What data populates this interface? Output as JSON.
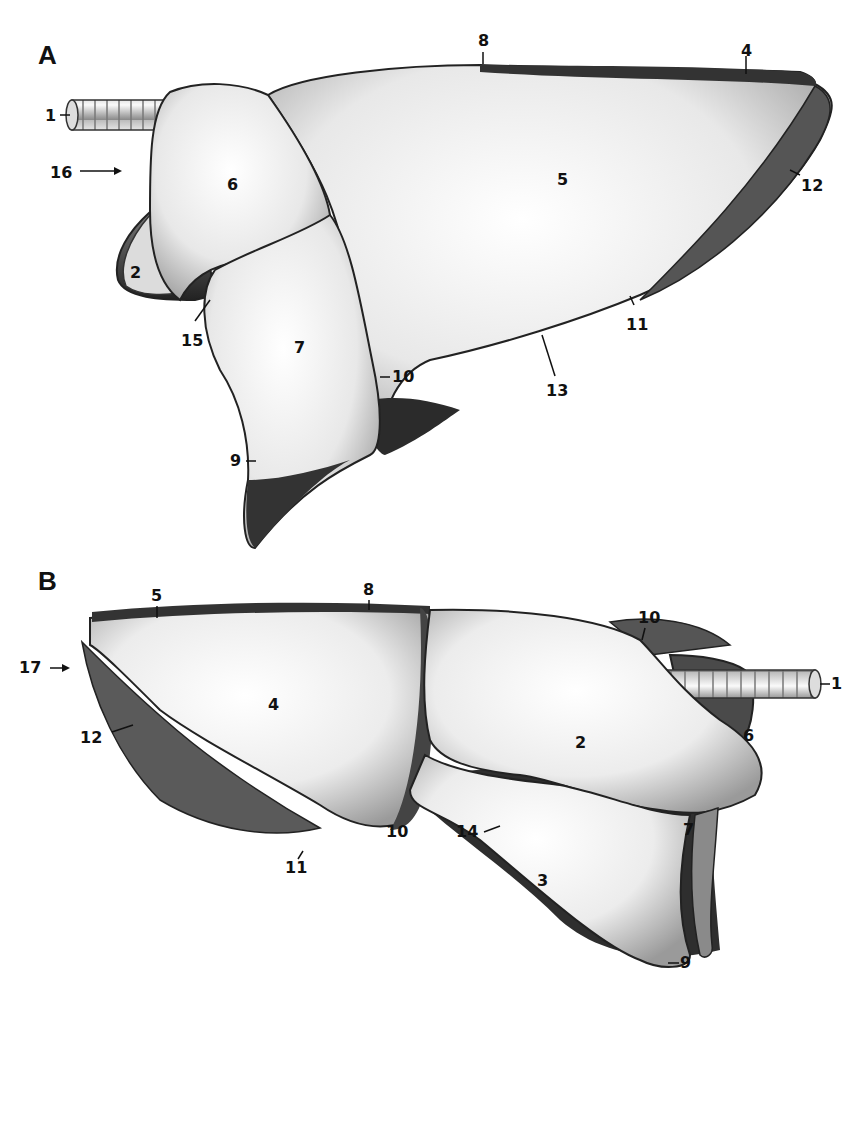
{
  "figure": {
    "panels": [
      {
        "id": "A",
        "letter": "A",
        "labels": {
          "l1": "1",
          "l16": "16",
          "l6": "6",
          "l2": "2",
          "l15": "15",
          "l7": "7",
          "l9": "9",
          "l10": "10",
          "l8": "8",
          "l4": "4",
          "l5": "5",
          "l12": "12",
          "l11": "11",
          "l13": "13"
        }
      },
      {
        "id": "B",
        "letter": "B",
        "labels": {
          "l5": "5",
          "l8": "8",
          "l10top": "10",
          "l1": "1",
          "l17": "17",
          "l12": "12",
          "l4": "4",
          "l2": "2",
          "l6": "6",
          "l14": "14",
          "l11": "11",
          "l10": "10",
          "l3": "3",
          "l7": "7",
          "l9": "9"
        }
      }
    ],
    "colors": {
      "background": "#ffffff",
      "ink": "#111111",
      "shade_dark": "#2a2a2a",
      "shade_mid": "#8a8a8a",
      "surface_light": "#f2f2f2"
    }
  }
}
